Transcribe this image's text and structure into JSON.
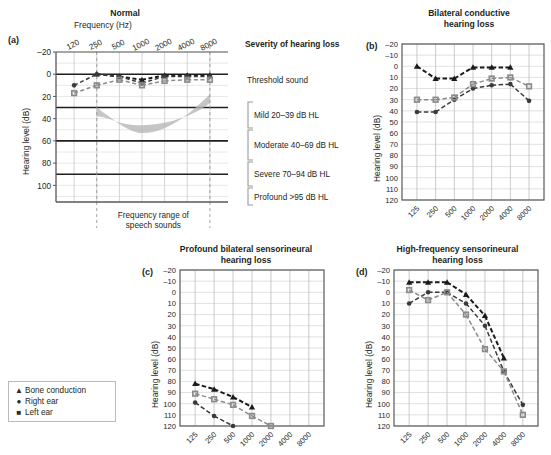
{
  "figure": {
    "legend": {
      "items": [
        {
          "marker": "triangle",
          "label": "Bone conduction"
        },
        {
          "marker": "circle",
          "label": "Right ear"
        },
        {
          "marker": "square",
          "label": "Left ear"
        }
      ]
    },
    "severity": {
      "heading": "Severity of hearing loss",
      "levels": [
        {
          "label": "Threshold sound",
          "from": -5,
          "to": 5
        },
        {
          "label": "Mild 20–39 dB HL",
          "from": 20,
          "to": 39
        },
        {
          "label": "Moderate 40–69 dB HL",
          "from": 40,
          "to": 69
        },
        {
          "label": "Severe 70–94 dB HL",
          "from": 70,
          "to": 94
        },
        {
          "label": "Profound >95 dB HL",
          "from": 95,
          "to": 120
        }
      ]
    }
  },
  "chart_data": [
    {
      "type": "line",
      "panel": "a",
      "title": "Normal",
      "xlabel": "Frequency (Hz)",
      "ylabel": "Hearing level  (dB)",
      "categories": [
        "120",
        "250",
        "500",
        "1000",
        "2000",
        "4000",
        "8000"
      ],
      "yticks": [
        -20,
        0,
        20,
        40,
        60,
        80,
        100
      ],
      "ylim": [
        -20,
        115
      ],
      "grid": true,
      "annotation": "Frequency range of\nspeech sounds",
      "speech_band": {
        "from_hz": "250",
        "to_hz": "8000"
      },
      "series": [
        {
          "name": "Bone conduction",
          "marker": "triangle",
          "values": [
            null,
            0,
            2,
            5,
            1,
            1,
            1
          ]
        },
        {
          "name": "Right ear",
          "marker": "circle",
          "values": [
            10,
            0,
            2,
            8,
            2,
            2,
            2
          ]
        },
        {
          "name": "Left ear",
          "marker": "square",
          "values": [
            17,
            10,
            5,
            10,
            6,
            5,
            5
          ]
        }
      ]
    },
    {
      "type": "line",
      "panel": "b",
      "title": "Bilateral conductive\nhearing loss",
      "xlabel": "",
      "ylabel": "Hearing level  (dB)",
      "categories": [
        "125",
        "250",
        "500",
        "1000",
        "2000",
        "4000",
        "8000"
      ],
      "yticks": [
        -20,
        -10,
        0,
        10,
        20,
        30,
        40,
        50,
        60,
        70,
        80,
        90,
        100,
        110,
        120
      ],
      "ylim": [
        -20,
        120
      ],
      "grid": true,
      "series": [
        {
          "name": "Bone conduction",
          "marker": "triangle",
          "values": [
            0,
            11,
            11,
            1,
            1,
            1,
            null
          ]
        },
        {
          "name": "Right ear",
          "marker": "circle",
          "values": [
            41,
            41,
            30,
            20,
            17,
            16,
            31
          ]
        },
        {
          "name": "Left ear",
          "marker": "square",
          "values": [
            30,
            30,
            28,
            16,
            11,
            10,
            18
          ]
        }
      ]
    },
    {
      "type": "line",
      "panel": "c",
      "title": "Profound bilateral sensorineural\nhearing loss",
      "xlabel": "",
      "ylabel": "Hearing level  (dB)",
      "categories": [
        "125",
        "250",
        "500",
        "1000",
        "2000",
        "4000",
        "8000"
      ],
      "yticks": [
        -20,
        -10,
        0,
        10,
        20,
        30,
        40,
        50,
        60,
        70,
        80,
        90,
        100,
        110,
        120
      ],
      "ylim": [
        -20,
        120
      ],
      "grid": true,
      "series": [
        {
          "name": "Bone conduction",
          "marker": "triangle",
          "values": [
            82,
            87,
            94,
            103,
            null,
            null,
            null
          ]
        },
        {
          "name": "Left ear",
          "marker": "square",
          "values": [
            91,
            96,
            101,
            111,
            120,
            null,
            null
          ]
        },
        {
          "name": "Right ear",
          "marker": "circle",
          "values": [
            99,
            111,
            120,
            null,
            null,
            null,
            null
          ]
        }
      ]
    },
    {
      "type": "line",
      "panel": "d",
      "title": "High-frequency sensorineural\nhearing loss",
      "xlabel": "",
      "ylabel": "Hearing level  (dB)",
      "categories": [
        "125",
        "250",
        "500",
        "1000",
        "2000",
        "4000",
        "8000"
      ],
      "yticks": [
        -20,
        -10,
        0,
        10,
        20,
        30,
        40,
        50,
        60,
        70,
        80,
        90,
        100,
        110,
        120
      ],
      "ylim": [
        -20,
        120
      ],
      "grid": true,
      "series": [
        {
          "name": "Bone conduction",
          "marker": "triangle",
          "values": [
            -9,
            -9,
            -9,
            2,
            21,
            59,
            null
          ]
        },
        {
          "name": "Right ear",
          "marker": "circle",
          "values": [
            10,
            0,
            0,
            10,
            30,
            71,
            101
          ]
        },
        {
          "name": "Left ear",
          "marker": "square",
          "values": [
            -2,
            7,
            0,
            20,
            51,
            71,
            110
          ]
        }
      ]
    }
  ]
}
